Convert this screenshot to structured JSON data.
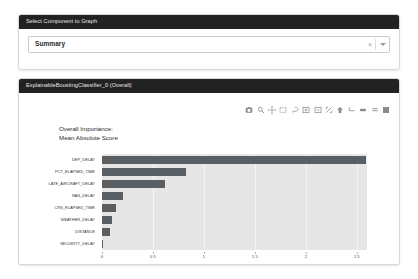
{
  "select_card": {
    "header": "Select Component to Graph",
    "selected_value": "Summary",
    "clear_icon": "×",
    "clear_label": "×",
    "caret_icon": "chevron-down-icon"
  },
  "graph_card": {
    "header": "ExplainableBoostingClassifier_0 (Overall)",
    "modebar": [
      {
        "name": "download-plot-as-png-icon",
        "label": "Download plot as a png"
      },
      {
        "name": "zoom-icon",
        "label": "Zoom"
      },
      {
        "name": "pan-icon",
        "label": "Pan"
      },
      {
        "name": "box-select-icon",
        "label": "Box Select"
      },
      {
        "name": "lasso-select-icon",
        "label": "Lasso Select"
      },
      {
        "name": "zoom-in-icon",
        "label": "Zoom in"
      },
      {
        "name": "zoom-out-icon",
        "label": "Zoom out"
      },
      {
        "name": "autoscale-icon",
        "label": "Autoscale"
      },
      {
        "name": "reset-axes-icon",
        "label": "Reset axes"
      },
      {
        "name": "toggle-spike-lines-icon",
        "label": "Toggle Spike Lines"
      },
      {
        "name": "show-closest-data-icon",
        "label": "Show closest data on hover"
      },
      {
        "name": "compare-data-on-hover-icon",
        "label": "Compare data on hover"
      },
      {
        "name": "plotly-logo-icon",
        "label": "Produced with Plotly"
      }
    ]
  },
  "chart_data": {
    "type": "bar",
    "orientation": "horizontal",
    "title": "Overall Importance:\nMean Absolute Score",
    "xlabel": "",
    "ylabel": "",
    "categories": [
      "DEP_DELAY",
      "PCT_ELAPSED_TIME",
      "LATE_AIRCRAFT_DELAY",
      "NAS_DELAY",
      "CRS_ELAPSED_TIME",
      "WEATHER_DELAY",
      "DISTANCE",
      "SECURITY_DELAY"
    ],
    "values": [
      2.59,
      0.82,
      0.62,
      0.21,
      0.135,
      0.1,
      0.075,
      0.012
    ],
    "xticks": [
      0,
      0.5,
      1,
      1.5,
      2,
      2.5
    ],
    "xticklabels": [
      "0",
      "0.5",
      "1",
      "1.5",
      "2",
      "2.5"
    ],
    "xlim": [
      0,
      2.6
    ],
    "grid": true,
    "legend": null,
    "bar_color": "#5a5f64",
    "plot_bgcolor": "#e6e6e6",
    "gridcolor": "#f4f4f4"
  }
}
